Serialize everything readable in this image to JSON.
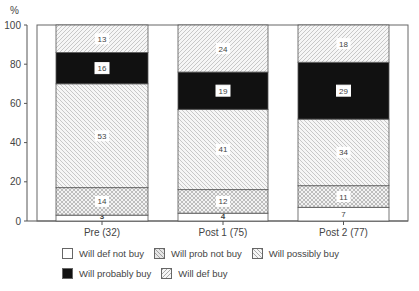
{
  "chart_data": {
    "type": "bar",
    "stacked": true,
    "title": "",
    "xlabel": "",
    "ylabel": "%",
    "ylim": [
      0,
      100
    ],
    "yticks": [
      0,
      20,
      40,
      60,
      80,
      100
    ],
    "categories": [
      "Pre (32)",
      "Post 1 (75)",
      "Post 2 (77)"
    ],
    "series": [
      {
        "name": "Will def not buy",
        "values": [
          3,
          4,
          7
        ],
        "pattern": "white"
      },
      {
        "name": "Will prob not buy",
        "values": [
          14,
          12,
          11
        ],
        "pattern": "crosshatch"
      },
      {
        "name": "Will possibly buy",
        "values": [
          53,
          41,
          34
        ],
        "pattern": "back-diagonal"
      },
      {
        "name": "Will probably buy",
        "values": [
          16,
          19,
          29
        ],
        "pattern": "black"
      },
      {
        "name": "Will def buy",
        "values": [
          13,
          24,
          18
        ],
        "pattern": "forward-diagonal"
      }
    ],
    "legend_position": "bottom",
    "grid": false
  },
  "legend": {
    "rows": [
      [
        {
          "label": "Will def not buy",
          "pattern": "white"
        },
        {
          "label": "Will prob not buy",
          "pattern": "crosshatch"
        },
        {
          "label": "Will possibly buy",
          "pattern": "back-diagonal"
        }
      ],
      [
        {
          "label": "Will probably buy",
          "pattern": "black"
        },
        {
          "label": "Will def buy",
          "pattern": "forward-diagonal"
        }
      ]
    ]
  }
}
